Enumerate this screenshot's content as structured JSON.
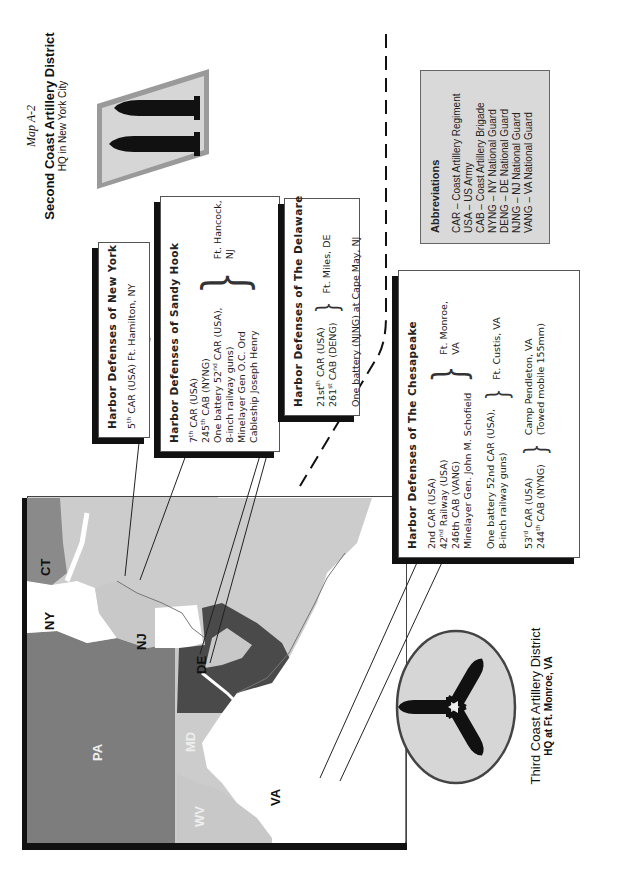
{
  "header": {
    "map_number": "Map A-2",
    "second_district_title": "Second Coast Artillery District",
    "second_district_hq": "HQ in New York City",
    "third_district_title": "Third Coast Artillery District",
    "third_district_hq": "HQ at Ft. Monroe, VA"
  },
  "map": {
    "states": [
      {
        "code": "CT",
        "color": "#8a8a8a"
      },
      {
        "code": "NY",
        "color": "#ffffff"
      },
      {
        "code": "NJ",
        "color": "#c8c8c8"
      },
      {
        "code": "PA",
        "color": "#7a7a7a"
      },
      {
        "code": "DE",
        "color": "#ffffff"
      },
      {
        "code": "MD",
        "color": "#4a4a4a"
      },
      {
        "code": "WV",
        "color": "#c8c8c8"
      },
      {
        "code": "VA",
        "color": "#ffffff"
      }
    ],
    "ocean_color": "#cfcfcf"
  },
  "harbor_defenses": {
    "new_york": {
      "title": "Harbor Defenses of New York",
      "line1_num": "5",
      "line1_sup": "th",
      "line1_rest": " CAR (USA) Ft. Hamilton, NY"
    },
    "sandy_hook": {
      "title": "Harbor Defenses of Sandy Hook",
      "units": [
        {
          "num": "7",
          "sup": "th",
          "rest": " CAR (USA)"
        },
        {
          "num": "245",
          "sup": "th",
          "rest": " CAB (NYNG)"
        },
        {
          "num": "One battery 52",
          "sup": "nd",
          "rest": " CAR (USA),"
        },
        {
          "num": "8-inch railway guns)",
          "sup": "",
          "rest": ""
        },
        {
          "num": "Minelayer Gen O.C. Ord",
          "sup": "",
          "rest": ""
        },
        {
          "num": "Cableship Joseph Henry",
          "sup": "",
          "rest": ""
        }
      ],
      "location": "Ft. Hancock,\nNJ"
    },
    "delaware": {
      "title": "Harbor Defenses of The Delaware",
      "units": [
        {
          "num": "21st",
          "sup": "th",
          "rest": " CAR (USA)"
        },
        {
          "num": "261",
          "sup": "st",
          "rest": " CAB (DENG)"
        }
      ],
      "location": "Ft. Miles, DE",
      "extra": "One battery (NJNG) at Cape May, NJ"
    },
    "chesapeake": {
      "title": "Harbor Defenses of The Chesapeake",
      "units": [
        {
          "num": "2nd CAR (USA)",
          "sup": "",
          "rest": ""
        },
        {
          "num": "42",
          "sup": "nd",
          "rest": " Railway (USA)"
        },
        {
          "num": "246th CAB (VANG)",
          "sup": "",
          "rest": ""
        },
        {
          "num": "Minelayer Gen. John M. Schofield",
          "sup": "",
          "rest": ""
        }
      ],
      "location": "Ft. Monroe,\nVA",
      "group2": [
        "One battery 52nd CAR (USA),",
        "8-inch railway guns)"
      ],
      "location2": "Ft. Custis, VA",
      "group3": [
        {
          "num": "53",
          "sup": "rd",
          "rest": " CAR (USA)"
        },
        {
          "num": "244",
          "sup": "th",
          "rest": " CAB (NYNG)"
        }
      ],
      "location3_line1": "Camp Pendleton, VA",
      "location3_line2": "(Towed mobile 155mm)"
    }
  },
  "abbreviations": {
    "title": "Abbreviations",
    "items": [
      "CAR – Coast Artillery Regiment",
      "USA – US Army",
      "CAB – Coast Artillery Brigade",
      "NYNG – NY National Guard",
      "DENG – DE National Guard",
      "NJNG – NJ National Guard",
      "VANG – VA National Guard"
    ]
  },
  "icons": {
    "second_district_patch": "twin-shells-parallelogram-icon",
    "third_district_patch": "three-shells-oval-icon"
  }
}
